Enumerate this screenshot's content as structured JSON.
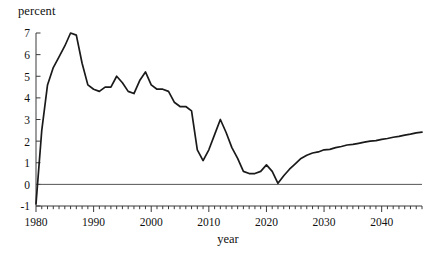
{
  "chart_data": {
    "type": "line",
    "title": "",
    "xlabel": "year",
    "ylabel": "percent",
    "xlim": [
      1980,
      2047
    ],
    "ylim": [
      -1,
      7
    ],
    "grid": false,
    "legend": "none",
    "zero_line": true,
    "y_ticks": [
      -1,
      0,
      1,
      2,
      3,
      4,
      5,
      6,
      7
    ],
    "y_tick_labels": [
      "-1",
      "0",
      "1",
      "2",
      "3",
      "4",
      "5",
      "6",
      "7"
    ],
    "x_ticks": [
      1980,
      1990,
      2000,
      2010,
      2020,
      2030,
      2040
    ],
    "x_tick_labels": [
      "1980",
      "1990",
      "2000",
      "2010",
      "2020",
      "2030",
      "2040"
    ],
    "x_minor_tick_interval": 1,
    "line_color": "#1a1a1a",
    "series": [
      {
        "name": "percent",
        "x": [
          1980,
          1981,
          1982,
          1983,
          1984,
          1985,
          1986,
          1987,
          1988,
          1989,
          1990,
          1991,
          1992,
          1993,
          1994,
          1995,
          1996,
          1997,
          1998,
          1999,
          2000,
          2001,
          2002,
          2003,
          2004,
          2005,
          2006,
          2007,
          2008,
          2009,
          2010,
          2011,
          2012,
          2013,
          2014,
          2015,
          2016,
          2017,
          2018,
          2019,
          2020,
          2021,
          2022,
          2023,
          2024,
          2025,
          2026,
          2027,
          2028,
          2029,
          2030,
          2031,
          2032,
          2033,
          2034,
          2035,
          2036,
          2037,
          2038,
          2039,
          2040,
          2041,
          2042,
          2043,
          2044,
          2045,
          2046,
          2047
        ],
        "values": [
          -0.9,
          2.5,
          4.6,
          5.4,
          5.9,
          6.4,
          7.0,
          6.9,
          5.6,
          4.6,
          4.4,
          4.3,
          4.5,
          4.5,
          5.0,
          4.7,
          4.3,
          4.2,
          4.8,
          5.2,
          4.6,
          4.4,
          4.4,
          4.3,
          3.8,
          3.6,
          3.6,
          3.4,
          1.6,
          1.1,
          1.6,
          2.3,
          3.0,
          2.4,
          1.7,
          1.2,
          0.6,
          0.5,
          0.5,
          0.6,
          0.9,
          0.6,
          0.05,
          0.4,
          0.7,
          0.95,
          1.2,
          1.35,
          1.45,
          1.5,
          1.6,
          1.62,
          1.7,
          1.75,
          1.82,
          1.85,
          1.9,
          1.95,
          2.0,
          2.02,
          2.08,
          2.12,
          2.18,
          2.22,
          2.28,
          2.32,
          2.38,
          2.42
        ]
      }
    ]
  },
  "axis": {
    "ylabel": "percent",
    "xlabel": "year"
  }
}
